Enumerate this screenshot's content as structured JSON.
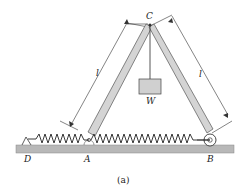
{
  "diagram": {
    "labels": {
      "C": "C",
      "A": "A",
      "B": "B",
      "D": "D",
      "W": "W",
      "l_left": "l",
      "l_right": "l",
      "caption": "(a)"
    },
    "colors": {
      "bar_fill": "#d4d4d4",
      "bar_stroke": "#555555",
      "ground_fill": "#b8b8b8",
      "spring": "#222222",
      "weight_fill": "#d0d0d0"
    }
  }
}
